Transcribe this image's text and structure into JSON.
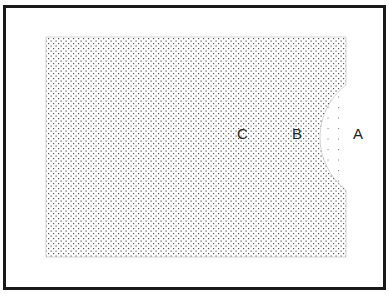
{
  "diagram": {
    "type": "region-diagram",
    "frame": {
      "border_color": "#1a1a1a"
    },
    "regions": [
      {
        "id": "C",
        "label": "C",
        "fill": "dense-stipple",
        "description": "dense stippled rectangle"
      },
      {
        "id": "B",
        "label": "B",
        "fill": "sparse-dot-grid",
        "description": "semicircular sparse-dotted region cut into right edge"
      },
      {
        "id": "A",
        "label": "A",
        "fill": "none",
        "description": "unshaded region right of rectangle"
      }
    ],
    "colors": {
      "stipple": "#555555",
      "sparse_dot": "#888888",
      "text": "#222222"
    }
  }
}
